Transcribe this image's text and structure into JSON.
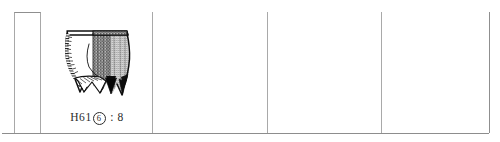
{
  "figure": {
    "type": "archaeological-artifact-catalog-row",
    "background_color": "#ffffff",
    "rule_color": "#9a9a9a"
  },
  "table": {
    "row_count": 1,
    "columns": [
      {
        "id": "index",
        "label": "",
        "content": "empty"
      },
      {
        "id": "specimen-1",
        "label": "",
        "content": "drawing"
      },
      {
        "id": "specimen-2",
        "label": "",
        "content": "empty"
      },
      {
        "id": "specimen-3",
        "label": "",
        "content": "empty"
      },
      {
        "id": "specimen-4",
        "label": "",
        "content": "empty"
      }
    ]
  },
  "specimen": {
    "caption": {
      "prefix": "H61",
      "circled_number": "6",
      "separator": " : ",
      "suffix": "8",
      "full_text": "H61⑥ : 8"
    },
    "drawing": {
      "name": "pottery-li-tripod-vessel",
      "description": "line drawing of a ceramic tripod vessel, left half outline with hatched rim band, right half rendered in dense stipple shading, three pointed hollow legs",
      "ink_color": "#101010"
    }
  }
}
